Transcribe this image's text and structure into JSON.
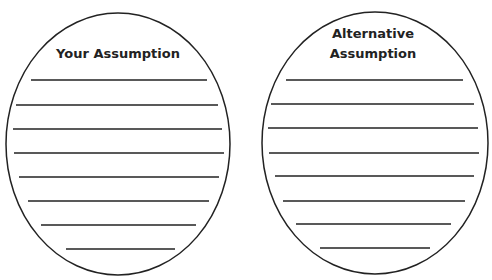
{
  "diagram": {
    "ovals": [
      {
        "title_lines": [
          "Your Assumption"
        ],
        "cx": 118,
        "cy": 144,
        "rx": 112,
        "ry": 131,
        "lines": [
          {
            "y": 80,
            "x1": 31,
            "x2": 207
          },
          {
            "y": 105,
            "x1": 16,
            "x2": 218
          },
          {
            "y": 129,
            "x1": 13,
            "x2": 222
          },
          {
            "y": 153,
            "x1": 14,
            "x2": 224
          },
          {
            "y": 177,
            "x1": 19,
            "x2": 219
          },
          {
            "y": 201,
            "x1": 28,
            "x2": 209
          },
          {
            "y": 225,
            "x1": 41,
            "x2": 196
          },
          {
            "y": 249,
            "x1": 66,
            "x2": 175
          }
        ]
      },
      {
        "title_lines": [
          "Alternative",
          "Assumption"
        ],
        "cx": 375,
        "cy": 143,
        "rx": 113,
        "ry": 131,
        "lines": [
          {
            "y": 80,
            "x1": 286,
            "x2": 463
          },
          {
            "y": 104,
            "x1": 271,
            "x2": 474
          },
          {
            "y": 128,
            "x1": 268,
            "x2": 478
          },
          {
            "y": 153,
            "x1": 269,
            "x2": 479
          },
          {
            "y": 176,
            "x1": 275,
            "x2": 474
          },
          {
            "y": 201,
            "x1": 283,
            "x2": 465
          },
          {
            "y": 224,
            "x1": 296,
            "x2": 451
          },
          {
            "y": 248,
            "x1": 320,
            "x2": 430
          }
        ]
      }
    ],
    "stroke_color": "#222222"
  }
}
